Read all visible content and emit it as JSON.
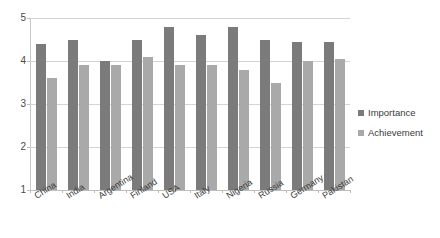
{
  "chart_data": {
    "type": "bar",
    "title": "",
    "subtitle": "",
    "xlabel": "",
    "ylabel": "",
    "ylim": [
      1,
      5
    ],
    "ytick_labels": [
      "1",
      "2",
      "3",
      "4",
      "5"
    ],
    "yticks": [
      1,
      2,
      3,
      4,
      5
    ],
    "grid": true,
    "legend_position": "right",
    "categories": [
      "China",
      "India",
      "Argentina",
      "Finland",
      "USA",
      "Italy",
      "Nigeria",
      "Russia",
      "Germany",
      "Pakistan"
    ],
    "series": [
      {
        "name": "Importance",
        "color": "#7b7b7b",
        "values": [
          4.4,
          4.5,
          4.0,
          4.5,
          4.8,
          4.6,
          4.8,
          4.5,
          4.45,
          4.45
        ]
      },
      {
        "name": "Achievement",
        "color": "#a9a9a9",
        "values": [
          3.6,
          3.9,
          3.9,
          4.1,
          3.9,
          3.9,
          3.8,
          3.5,
          4.0,
          4.05
        ]
      }
    ]
  },
  "legend": {
    "items": [
      {
        "label": "Importance",
        "color": "#7b7b7b"
      },
      {
        "label": "Achievement",
        "color": "#a9a9a9"
      }
    ]
  }
}
